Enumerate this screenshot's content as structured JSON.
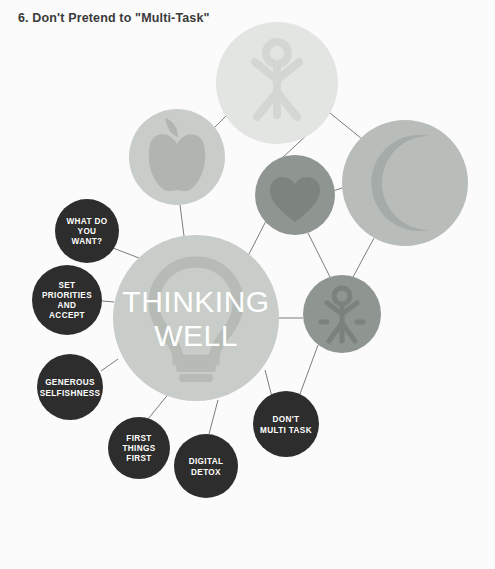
{
  "page": {
    "title": "6. Don't Pretend to \"Multi-Task\"",
    "footer_label": "THINKING Well",
    "footer_divider": "|",
    "page_number": "18",
    "background_color": "#fbfbfb"
  },
  "diagram": {
    "type": "node-network",
    "hub": {
      "name": "thinking-well-hub",
      "line1": "THINKING",
      "line2": "WELL",
      "icon": "lightbulb-icon",
      "circle_color": "#c9cdc9",
      "icon_color": "#b6bbb6",
      "cx": 196,
      "cy": 318,
      "r": 83
    },
    "icon_nodes": [
      {
        "name": "stretch-person-node",
        "icon": "person-stretch-icon",
        "circle_color": "#e3e5e3",
        "icon_color": "#d3d6d3",
        "cx": 277,
        "cy": 83,
        "r": 61
      },
      {
        "name": "nutrition-apple-node",
        "icon": "apple-icon",
        "circle_color": "#c9cdc9",
        "icon_color": "#b0b5b0",
        "cx": 177,
        "cy": 157,
        "r": 48
      },
      {
        "name": "heart-node",
        "icon": "heart-icon",
        "circle_color": "#8f9590",
        "icon_color": "#7d847f",
        "cx": 295,
        "cy": 195,
        "r": 40
      },
      {
        "name": "sleep-moon-node",
        "icon": "crescent-moon-icon",
        "circle_color": "#b8bdba",
        "icon_color": "#a5aba8",
        "cx": 405,
        "cy": 183,
        "r": 63
      },
      {
        "name": "movement-person-node",
        "icon": "person-arms-up-icon",
        "circle_color": "#8f9590",
        "icon_color": "#7b827d",
        "cx": 342,
        "cy": 314,
        "r": 39
      }
    ],
    "label_nodes": [
      {
        "name": "what-do-you-want-node",
        "lines": [
          "WHAT DO",
          "YOU",
          "WANT?"
        ],
        "circle_color": "#2d2d2d",
        "cx": 87,
        "cy": 231,
        "r": 32
      },
      {
        "name": "set-priorities-node",
        "lines": [
          "SET",
          "PRIORITIES",
          "AND",
          "ACCEPT"
        ],
        "circle_color": "#2d2d2d",
        "cx": 67,
        "cy": 300,
        "r": 35
      },
      {
        "name": "generous-selfishness-node",
        "lines": [
          "GENEROUS",
          "SELFISHNESS"
        ],
        "circle_color": "#2d2d2d",
        "cx": 70,
        "cy": 387,
        "r": 33
      },
      {
        "name": "first-things-first-node",
        "lines": [
          "FIRST",
          "THINGS",
          "FIRST"
        ],
        "circle_color": "#2d2d2d",
        "cx": 139,
        "cy": 448,
        "r": 31
      },
      {
        "name": "digital-detox-node",
        "lines": [
          "DIGITAL",
          "DETOX"
        ],
        "circle_color": "#2d2d2d",
        "cx": 206,
        "cy": 466,
        "r": 32
      },
      {
        "name": "dont-multi-task-node",
        "lines": [
          "DON'T",
          "MULTI TASK"
        ],
        "circle_color": "#2d2d2d",
        "cx": 286,
        "cy": 424,
        "r": 33
      }
    ],
    "connector_color": "#7c7c7c"
  }
}
